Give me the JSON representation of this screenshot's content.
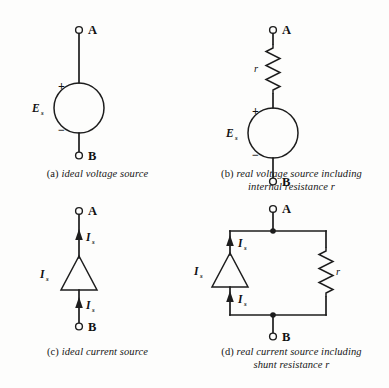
{
  "figure": {
    "background_color": "#fdfdfc",
    "ink_color": "#1d1d1d"
  },
  "panels": [
    {
      "id": "a",
      "tag": "(a)",
      "caption": "ideal voltage source",
      "caption_line2": "",
      "terminals": [
        {
          "name": "A",
          "label": "A"
        },
        {
          "name": "B",
          "label": "B"
        }
      ],
      "source_label": "E",
      "source_subscript": "s",
      "polarity_plus": "+",
      "polarity_minus": "−",
      "symbol": "circle-voltage-source"
    },
    {
      "id": "b",
      "tag": "(b)",
      "caption": "real voltage source including",
      "caption_line2": "internal resistance r",
      "terminals": [
        {
          "name": "A",
          "label": "A"
        },
        {
          "name": "B",
          "label": "B"
        }
      ],
      "source_label": "E",
      "source_subscript": "s",
      "polarity_plus": "+",
      "polarity_minus": "−",
      "resistor_label": "r",
      "symbol": "circle-voltage-source-with-series-resistor"
    },
    {
      "id": "c",
      "tag": "(c)",
      "caption": "ideal current source",
      "caption_line2": "",
      "terminals": [
        {
          "name": "A",
          "label": "A"
        },
        {
          "name": "B",
          "label": "B"
        }
      ],
      "source_label": "I",
      "source_subscript": "s",
      "current_label_top": "I",
      "current_label_bottom": "I",
      "symbol": "triangle-current-source"
    },
    {
      "id": "d",
      "tag": "(d)",
      "caption": "real current source including",
      "caption_line2": "shunt resistance r",
      "terminals": [
        {
          "name": "A",
          "label": "A"
        },
        {
          "name": "B",
          "label": "B"
        }
      ],
      "source_label": "I",
      "source_subscript": "s",
      "current_label_top": "I",
      "current_label_bottom": "I",
      "resistor_label": "r",
      "symbol": "triangle-current-source-with-shunt-resistor"
    }
  ]
}
